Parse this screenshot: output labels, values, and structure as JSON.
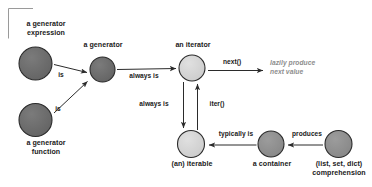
{
  "diagram": {
    "background_color": "#ffffff",
    "corner_bracket": {
      "name": "corner-bracket",
      "color": "#9a9a9a"
    },
    "colors": {
      "node_dark": "#6a6a6a",
      "node_medium": "#8f8f8f",
      "node_light": "#d4d4d4",
      "node_stroke": "#2b2b2b",
      "arrow": "#2b2b2b",
      "text": "#1a1a1a",
      "note_text": "#8d8d8d"
    },
    "nodes": [
      {
        "id": "generator-expression",
        "label": "a generator\nexpression",
        "label_position": "above",
        "fill": "#6a6a6a",
        "cx": 35.5,
        "cy": 63.5,
        "r": 16.5
      },
      {
        "id": "generator-function",
        "label": "a generator\nfunction",
        "label_position": "below",
        "fill": "#6a6a6a",
        "cx": 35.5,
        "cy": 120.0,
        "r": 16.5
      },
      {
        "id": "generator",
        "label": "a generator",
        "label_position": "above",
        "fill": "#6a6a6a",
        "cx": 102.5,
        "cy": 69.5,
        "r": 12.5
      },
      {
        "id": "iterator",
        "label": "an iterator",
        "label_position": "above",
        "fill": "#d4d4d4",
        "cx": 192.0,
        "cy": 68.0,
        "r": 13.0
      },
      {
        "id": "iterable",
        "label": "(an) iterable",
        "label_position": "below",
        "fill": "#d4d4d4",
        "cx": 191.0,
        "cy": 144.0,
        "r": 13.5
      },
      {
        "id": "container",
        "label": "a container",
        "label_position": "below",
        "fill": "#8f8f8f",
        "cx": 271.0,
        "cy": 144.0,
        "r": 13.0
      },
      {
        "id": "comprehension",
        "label": "(list, set, dict)\ncomprehension",
        "label_position": "below",
        "fill": "#8f8f8f",
        "cx": 338.5,
        "cy": 144.0,
        "r": 13.5
      }
    ],
    "edges": [
      {
        "id": "expression-is-generator",
        "label": "is",
        "from": "generator-expression",
        "to": "generator"
      },
      {
        "id": "function-is-generator",
        "label": "is",
        "from": "generator-function",
        "to": "generator"
      },
      {
        "id": "generator-always-is-iterator",
        "label": "always is",
        "from": "generator",
        "to": "iterator"
      },
      {
        "id": "iterator-next",
        "label": "next()",
        "from": "iterator",
        "to": "lazy-note"
      },
      {
        "id": "iterator-always-is-iterable",
        "label": "always is",
        "from": "iterator",
        "to": "iterable"
      },
      {
        "id": "iterable-iter-iterator",
        "label": "iter()",
        "from": "iterable",
        "to": "iterator"
      },
      {
        "id": "container-typically-is-iterable",
        "label": "typically is",
        "from": "container",
        "to": "iterable"
      },
      {
        "id": "comprehension-produces-container",
        "label": "produces",
        "from": "comprehension",
        "to": "container"
      }
    ],
    "notes": [
      {
        "id": "lazy-note",
        "text": "lazily produce\nnext value"
      }
    ]
  }
}
